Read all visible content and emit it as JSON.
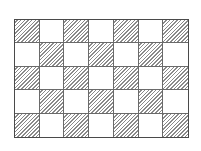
{
  "diagram": {
    "type": "checkerboard-grid",
    "rows": 5,
    "columns": 7,
    "pattern": "hatched cells where (row + column) is even, starting with top-left hatched",
    "hatch_style": "diagonal lines (/)",
    "colors": {
      "border": "#4a4a4a",
      "grid_lines": "#6a6a6a",
      "hatch": "#8a8a8a",
      "background": "#ffffff"
    },
    "cells": [
      [
        "hatched",
        "plain",
        "hatched",
        "plain",
        "hatched",
        "plain",
        "hatched"
      ],
      [
        "plain",
        "hatched",
        "plain",
        "hatched",
        "plain",
        "hatched",
        "plain"
      ],
      [
        "hatched",
        "plain",
        "hatched",
        "plain",
        "hatched",
        "plain",
        "hatched"
      ],
      [
        "plain",
        "hatched",
        "plain",
        "hatched",
        "plain",
        "hatched",
        "plain"
      ],
      [
        "hatched",
        "plain",
        "hatched",
        "plain",
        "hatched",
        "plain",
        "hatched"
      ]
    ]
  }
}
